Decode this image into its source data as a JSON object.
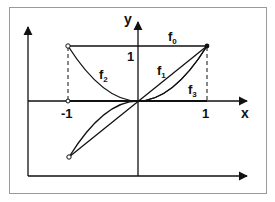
{
  "diagram": {
    "title": "",
    "axes": {
      "x_label": "x",
      "y_label": "y",
      "ticks": {
        "x_neg_one": "-1",
        "x_pos_one": "1",
        "y_pos_one": "1"
      }
    },
    "functions": [
      {
        "id": "f0",
        "name": "f",
        "sub": "0",
        "expr": "x^0",
        "shape": "horizontal line y=1 from x=-1 to x=1"
      },
      {
        "id": "f1",
        "name": "f",
        "sub": "1",
        "expr": "x^1",
        "shape": "straight line through origin from (-1,-1) to (1,1)"
      },
      {
        "id": "f2",
        "name": "f",
        "sub": "2",
        "expr": "x^2",
        "shape": "parabola from (-1,1) to (1,1)"
      },
      {
        "id": "f3",
        "name": "f",
        "sub": "3",
        "expr": "x^3",
        "shape": "cubic from (-1,-1) to (1,1)"
      }
    ],
    "markers": {
      "open_points": [
        "(-1,1)",
        "(-1,-1)"
      ],
      "closed_points": [
        "(1,1)"
      ]
    },
    "colors": {
      "line": "#111111",
      "frame": "#9a9a9a",
      "background": "#ffffff"
    }
  }
}
